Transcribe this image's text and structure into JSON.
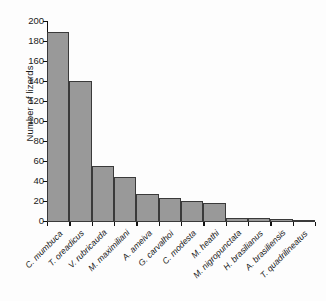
{
  "chart_data": {
    "type": "bar",
    "title": "",
    "xlabel": "",
    "ylabel": "Number of lizards",
    "ylim": [
      0,
      200
    ],
    "yticks": [
      0,
      20,
      40,
      60,
      80,
      100,
      120,
      140,
      160,
      180,
      200
    ],
    "grid": false,
    "legend": null,
    "bar_style": {
      "fill": "#999999",
      "edge": "#3a3a3a",
      "adjacent": true
    },
    "categories": [
      "C. mumbuca",
      "T. oreadicus",
      "V. rubricauda",
      "M. maximiliani",
      "A. ameiva",
      "G. carvalhoi",
      "C. modesta",
      "M. heathi",
      "M. nigropunctata",
      "H. brasilianus",
      "A. brasiliensis",
      "T. quadrilineatus"
    ],
    "values": [
      190,
      141,
      56,
      45,
      28,
      24,
      21,
      19,
      4,
      4,
      3,
      1
    ]
  },
  "axis": {
    "y_title": "Number of lizards"
  }
}
